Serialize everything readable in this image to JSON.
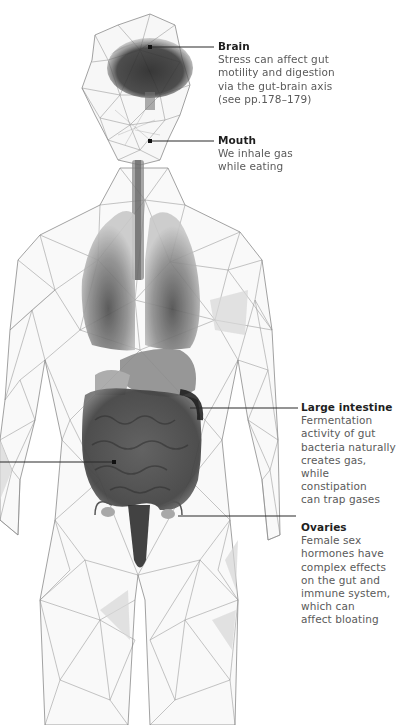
{
  "figure": {
    "colors": {
      "background": "#ffffff",
      "wire": "#7a7a7a",
      "organ_dark": "#2e2e2e",
      "organ_mid": "#808080",
      "label_title": "#1e1e1e",
      "label_body": "#5a5a5a",
      "leader": "#2a2a2a"
    }
  },
  "callouts": [
    {
      "id": "brain",
      "title": "Brain",
      "body": "Stress can affect gut\nmotility and digestion\nvia the gut-brain axis\n(see pp.178–179)"
    },
    {
      "id": "mouth",
      "title": "Mouth",
      "body": "We inhale gas\nwhile eating"
    },
    {
      "id": "large-intestine",
      "title": "Large intestine",
      "body": "Fermentation\nactivity of gut\nbacteria naturally\ncreates gas, while\nconstipation\ncan trap gases"
    },
    {
      "id": "ovaries",
      "title": "Ovaries",
      "body": "Female sex\nhormones have\ncomplex effects\non the gut and\nimmune system,\nwhich can\naffect bloating"
    }
  ]
}
